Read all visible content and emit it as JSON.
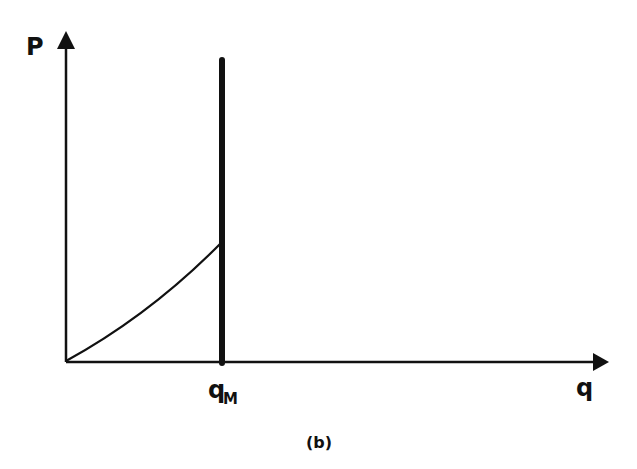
{
  "figure": {
    "caption": "(b)",
    "y_axis_label": "P",
    "x_axis_label": "q",
    "marker_label_main": "q",
    "marker_label_sub": "M",
    "colors": {
      "ink": "#111111",
      "background": "#ffffff"
    }
  },
  "diagram": {
    "type": "economics price-quantity diagram",
    "elements": [
      {
        "name": "vertical-supply-line",
        "description": "thick vertical line at q = qM"
      },
      {
        "name": "rising-curve",
        "description": "convex upward curve from origin to the vertical line at qM"
      }
    ]
  }
}
